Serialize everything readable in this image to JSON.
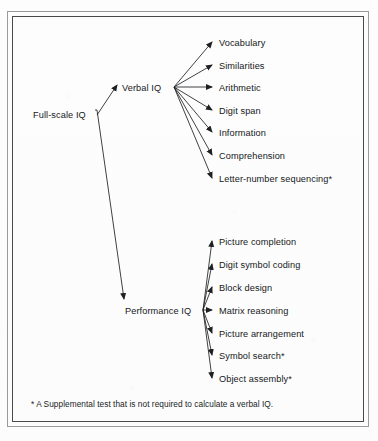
{
  "diagram": {
    "root": {
      "label": "Full-scale IQ",
      "x": 33,
      "y": 117
    },
    "branches": [
      {
        "name": "verbal",
        "label": "Verbal IQ",
        "x": 122,
        "y": 90,
        "hub": {
          "x": 174,
          "y": 87
        },
        "leaves": [
          {
            "label": "Vocabulary",
            "y": 45
          },
          {
            "label": "Similarities",
            "y": 68
          },
          {
            "label": "Arithmetic",
            "y": 90
          },
          {
            "label": "Digit span",
            "y": 113
          },
          {
            "label": "Information",
            "y": 135
          },
          {
            "label": "Comprehension",
            "y": 158
          },
          {
            "label": "Letter-number sequencing*",
            "y": 181
          }
        ]
      },
      {
        "name": "performance",
        "label": "Performance IQ",
        "x": 125,
        "y": 313,
        "hub": {
          "x": 203,
          "y": 310
        },
        "leaves": [
          {
            "label": "Picture completion",
            "y": 244
          },
          {
            "label": "Digit symbol coding",
            "y": 267
          },
          {
            "label": "Block design",
            "y": 290
          },
          {
            "label": "Matrix reasoning",
            "y": 313
          },
          {
            "label": "Picture arrangement",
            "y": 336
          },
          {
            "label": "Symbol search*",
            "y": 358
          },
          {
            "label": "Object assembly*",
            "y": 381
          }
        ]
      }
    ],
    "leaf_label_x": 219,
    "footnote": "* A Supplemental test that is not required to calculate a verbal IQ.",
    "colors": {
      "line": "#1e2022",
      "text": "#16181a",
      "outer_border": "#9a9a9a",
      "inner_border": "#4a4a4a",
      "background": "#fdfdfd"
    }
  }
}
